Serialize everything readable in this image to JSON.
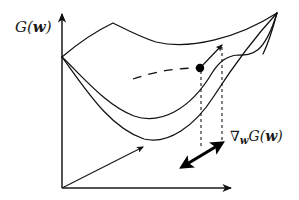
{
  "figure": {
    "kind": "diagram",
    "caption_type": "gradient-of-a-cost-surface",
    "background_color": "#ffffff",
    "stroke_color": "#111111",
    "labels": {
      "y_axis": {
        "text": "G(w)",
        "func": "G",
        "open_paren": "(",
        "variable": "w",
        "close_paren": ")"
      },
      "gradient": {
        "text": "∇wG(w)",
        "nabla": "∇",
        "subscript": "w",
        "func": "G",
        "open_paren": "(",
        "variable": "w",
        "close_paren": ")"
      }
    },
    "elements": [
      {
        "name": "vertical-axis",
        "role": "axis",
        "arrow": "up"
      },
      {
        "name": "horizontal-axis",
        "role": "axis",
        "arrow": "right"
      },
      {
        "name": "depth-axis",
        "role": "axis",
        "arrow": "up-right"
      },
      {
        "name": "top-surface-curve",
        "role": "surface-boundary"
      },
      {
        "name": "middle-surface-curve",
        "role": "surface-boundary"
      },
      {
        "name": "bottom-surface-curve",
        "role": "surface-boundary"
      },
      {
        "name": "right-surface-edge",
        "role": "surface-boundary"
      },
      {
        "name": "hidden-dashed-curve",
        "role": "occluded-contour"
      },
      {
        "name": "evaluation-point",
        "role": "point"
      },
      {
        "name": "tangent-direction-arrow",
        "role": "annotation-arrow"
      },
      {
        "name": "left-drop-line",
        "role": "projection-guide"
      },
      {
        "name": "right-drop-line",
        "role": "projection-guide"
      },
      {
        "name": "gradient-vector-arrow",
        "role": "annotation-arrow",
        "heads": 2
      }
    ]
  }
}
